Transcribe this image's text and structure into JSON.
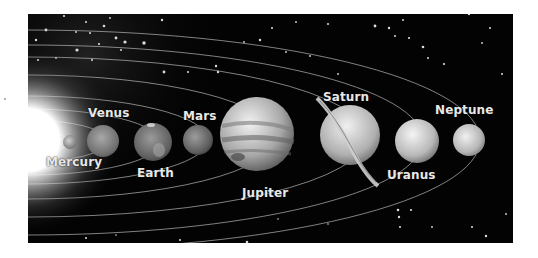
{
  "diagram": {
    "type": "solar-system",
    "color_mode": "grayscale",
    "background": "#030303",
    "sun": {
      "label": "",
      "cx": 0,
      "cy": 126,
      "r": 34
    },
    "planets": [
      {
        "name": "Mercury",
        "label": "Mercury",
        "cx": 42,
        "cy": 128,
        "r": 7,
        "label_x": 18,
        "label_y": 141
      },
      {
        "name": "Venus",
        "label": "Venus",
        "cx": 75,
        "cy": 127,
        "r": 16,
        "label_x": 60,
        "label_y": 92
      },
      {
        "name": "Earth",
        "label": "Earth",
        "cx": 125,
        "cy": 128,
        "r": 19,
        "label_x": 109,
        "label_y": 152
      },
      {
        "name": "Mars",
        "label": "Mars",
        "cx": 170,
        "cy": 126,
        "r": 15,
        "label_x": 155,
        "label_y": 95
      },
      {
        "name": "Jupiter",
        "label": "Jupiter",
        "cx": 229,
        "cy": 120,
        "r": 37,
        "label_x": 214,
        "label_y": 172
      },
      {
        "name": "Saturn",
        "label": "Saturn",
        "cx": 322,
        "cy": 121,
        "r": 30,
        "label_x": 295,
        "label_y": 76
      },
      {
        "name": "Uranus",
        "label": "Uranus",
        "cx": 389,
        "cy": 127,
        "r": 22,
        "label_x": 359,
        "label_y": 154
      },
      {
        "name": "Neptune",
        "label": "Neptune",
        "cx": 441,
        "cy": 126,
        "r": 16,
        "label_x": 407,
        "label_y": 89
      }
    ]
  }
}
